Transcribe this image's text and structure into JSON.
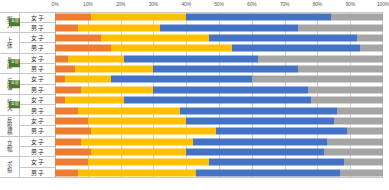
{
  "chart_data": {
    "type": "bar",
    "subtype": "stacked-horizontal-100percent",
    "title": "",
    "xlabel": "",
    "ylabel": "",
    "xlim": [
      0,
      100
    ],
    "xticks": [
      "0%",
      "10%",
      "20%",
      "30%",
      "40%",
      "50%",
      "60%",
      "70%",
      "80%",
      "90%",
      "100%"
    ],
    "xtick_values": [
      0,
      10,
      20,
      30,
      40,
      50,
      60,
      70,
      80,
      90,
      100
    ],
    "grid": true,
    "legend": "none",
    "series": [
      {
        "name": "segment-1",
        "color": "#ED7D31"
      },
      {
        "name": "segment-2",
        "color": "#FFC000"
      },
      {
        "name": "segment-3",
        "color": "#4472C4"
      },
      {
        "name": "segment-4",
        "color": "#A5A5A5"
      }
    ],
    "groups": [
      {
        "label": "握力",
        "badge": "全国",
        "rows": [
          {
            "sex": "女子",
            "values": [
              11,
              29,
              44,
              16
            ]
          },
          {
            "sex": "男子",
            "values": [
              7,
              25,
              42,
              26
            ]
          }
        ]
      },
      {
        "label": "上体",
        "badge": "",
        "rows": [
          {
            "sex": "女子",
            "values": [
              14,
              33,
              45,
              8
            ]
          },
          {
            "sex": "男子",
            "values": [
              17,
              37,
              39,
              7
            ]
          }
        ]
      },
      {
        "label": "長座",
        "badge": "全国",
        "rows": [
          {
            "sex": "女子",
            "values": [
              4,
              17,
              41,
              38
            ]
          },
          {
            "sex": "男子",
            "values": [
              6,
              24,
              44,
              26
            ]
          }
        ]
      },
      {
        "label": "反復",
        "badge": "全国",
        "rows": [
          {
            "sex": "女子",
            "values": [
              3,
              14,
              43,
              40
            ]
          },
          {
            "sex": "男子",
            "values": [
              8,
              22,
              47,
              23
            ]
          }
        ]
      },
      {
        "label": "持久",
        "badge": "全国",
        "rows": [
          {
            "sex": "女子",
            "values": [
              3,
              18,
              57,
              22
            ]
          },
          {
            "sex": "男子",
            "values": [
              7,
              31,
              48,
              14
            ]
          }
        ]
      },
      {
        "label": "反復横",
        "badge": "",
        "rows": [
          {
            "sex": "女子",
            "values": [
              10,
              30,
              45,
              15
            ]
          },
          {
            "sex": "男子",
            "values": [
              11,
              38,
              40,
              11
            ]
          }
        ]
      },
      {
        "label": "立幅",
        "badge": "",
        "rows": [
          {
            "sex": "女子",
            "values": [
              8,
              34,
              41,
              17
            ]
          },
          {
            "sex": "男子",
            "values": [
              11,
              29,
              42,
              18
            ]
          }
        ]
      },
      {
        "label": "ボ投",
        "badge": "",
        "rows": [
          {
            "sex": "女子",
            "values": [
              10,
              37,
              41,
              12
            ]
          },
          {
            "sex": "男子",
            "values": [
              7,
              36,
              44,
              13
            ]
          }
        ]
      }
    ]
  }
}
